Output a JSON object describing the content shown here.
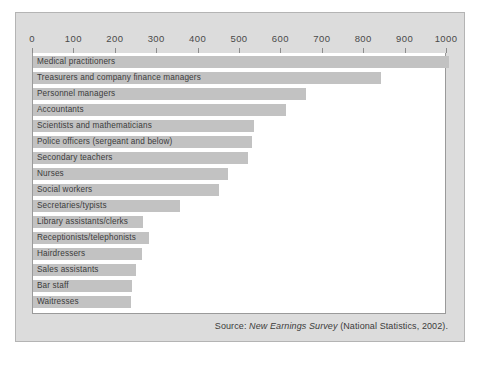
{
  "figure": {
    "background_color": "#dcdcdc",
    "plot_background_color": "#ffffff",
    "bar_color": "#c2c2c2",
    "border_color": "#9a9a9a"
  },
  "source_note": {
    "prefix": "Source: ",
    "publication": "New Earnings Survey",
    "suffix": " (National Statistics, 2002)."
  },
  "chart_data": {
    "type": "bar",
    "orientation": "horizontal",
    "title": "",
    "subtitle": "",
    "xlabel": "",
    "ylabel": "",
    "xlim": [
      0,
      1000
    ],
    "xticks": [
      0,
      100,
      200,
      300,
      400,
      500,
      600,
      700,
      800,
      900,
      1000
    ],
    "xtick_labels": [
      "0",
      "100",
      "200",
      "300",
      "400",
      "500",
      "600",
      "700",
      "800",
      "900",
      "1000"
    ],
    "grid": false,
    "legend": false,
    "legend_position": "none",
    "categories": [
      "Medical practitioners",
      "Treasurers and company finance managers",
      "Personnel managers",
      "Accountants",
      "Scientists and mathematicians",
      "Police officers (sergeant and below)",
      "Secondary teachers",
      "Nurses",
      "Social workers",
      "Secretaries/typists",
      "Library assistants/clerks",
      "Receptionists/telephonists",
      "Hairdressers",
      "Sales assistants",
      "Bar staff",
      "Waitresses"
    ],
    "values": [
      1005,
      840,
      660,
      610,
      535,
      530,
      520,
      470,
      450,
      355,
      265,
      280,
      263,
      248,
      238,
      236
    ]
  }
}
